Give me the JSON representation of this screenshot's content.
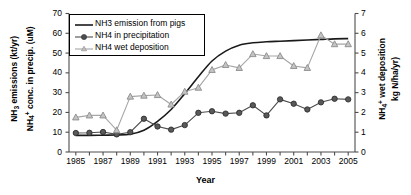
{
  "chart_data": {
    "type": "line",
    "title": "",
    "xlabel": "Year",
    "ylabel_left_line1": "NH3 emissions (kt/yr)",
    "ylabel_left_line2": "NH4+ conc. in precip. (uM)",
    "ylabel_right_line1": "NH4+ wet deposition",
    "ylabel_right_line2": "kg N/ha/yr)",
    "grid": false,
    "legend_position": "upper-left-inside",
    "x": [
      1985,
      1986,
      1987,
      1988,
      1989,
      1990,
      1991,
      1992,
      1993,
      1994,
      1995,
      1996,
      1997,
      1998,
      1999,
      2000,
      2001,
      2002,
      2003,
      2004,
      2005
    ],
    "xlim": [
      1984.5,
      2005.5
    ],
    "xticks": [
      1985,
      1987,
      1989,
      1991,
      1993,
      1995,
      1997,
      1999,
      2001,
      2003,
      2005
    ],
    "xticks_all": [
      1985,
      1986,
      1987,
      1988,
      1989,
      1990,
      1991,
      1992,
      1993,
      1994,
      1995,
      1996,
      1997,
      1998,
      1999,
      2000,
      2001,
      2002,
      2003,
      2004,
      2005
    ],
    "ylim_left": [
      0,
      70
    ],
    "yticks_left": [
      0,
      10,
      20,
      30,
      40,
      50,
      60,
      70
    ],
    "ylim_right": [
      0,
      7
    ],
    "yticks_right": [
      0,
      1,
      2,
      3,
      4,
      5,
      6,
      7
    ],
    "series": [
      {
        "name": "NH3 emission from pigs",
        "axis": "left",
        "color": "#1a1a1a",
        "marker": "none",
        "linewidth": 1.6,
        "values": [
          8.4,
          8.4,
          8.5,
          8.6,
          9.0,
          11.0,
          15.5,
          21.5,
          29.5,
          38.0,
          46.0,
          51.0,
          54.0,
          55.2,
          55.7,
          56.0,
          56.3,
          56.6,
          56.9,
          57.2,
          57.3
        ]
      },
      {
        "name": "NH4 in precipitation",
        "axis": "left",
        "color": "#4d4d4d",
        "marker": "circle",
        "linewidth": 1.1,
        "values": [
          9.6,
          9.7,
          10.1,
          8.9,
          10.0,
          16.8,
          12.9,
          11.3,
          13.6,
          19.8,
          20.6,
          19.4,
          19.8,
          23.6,
          18.5,
          26.6,
          24.4,
          21.5,
          25.1,
          26.9,
          26.6
        ]
      },
      {
        "name": "NH4 wet deposition",
        "axis": "right",
        "color": "#a6a6a6",
        "marker": "triangle",
        "linewidth": 1.1,
        "values": [
          1.75,
          1.85,
          1.85,
          1.1,
          2.8,
          2.85,
          2.88,
          2.4,
          3.05,
          3.25,
          4.15,
          4.4,
          4.25,
          4.95,
          4.85,
          4.85,
          4.35,
          4.25,
          5.9,
          5.45,
          5.45
        ]
      }
    ]
  },
  "legend": {
    "items": [
      {
        "label": "NH3 emission from pigs",
        "key": "line"
      },
      {
        "label": "NH4 in precipitation",
        "key": "line-circle"
      },
      {
        "label": "NH4 wet deposition",
        "key": "line-triangle"
      }
    ]
  },
  "axes": {
    "x_title": "Year",
    "left_title_parts": [
      "NH",
      "3",
      " emissions (kt/yr)",
      "NH",
      "4",
      "+",
      " conc. in precip. (uM)"
    ],
    "right_title_parts": [
      "NH",
      "4",
      "+",
      " wet deposition",
      "kg N/ha/yr)"
    ]
  },
  "colors": {
    "emission_line": "#1a1a1a",
    "precip_marker": "#4d4d4d",
    "deposition_marker": "#a6a6a6",
    "axis": "#4d4d4d",
    "background": "#ffffff"
  }
}
